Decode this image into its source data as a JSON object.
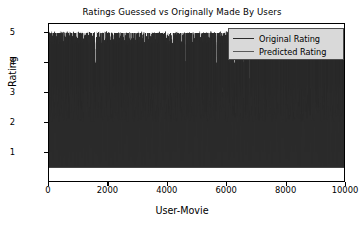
{
  "chart_data": {
    "type": "line",
    "title": "Ratings Guessed vs Originally Made By Users",
    "xlabel": "User-Movie",
    "ylabel": "Rating",
    "xlim": [
      0,
      10000
    ],
    "ylim": [
      0,
      5.3
    ],
    "grid": false,
    "legend_position": "upper right",
    "xticks": [
      "0",
      "2000",
      "4000",
      "6000",
      "8000",
      "10000"
    ],
    "xtick_values": [
      0,
      2000,
      4000,
      6000,
      8000,
      10000
    ],
    "yticks": [
      "1",
      "2",
      "3",
      "4",
      "5"
    ],
    "ytick_values": [
      1,
      2,
      3,
      4,
      5
    ],
    "series": [
      {
        "name": "Original Rating",
        "color": "#2b2b2b",
        "n_points": 10000,
        "value_range": [
          1,
          5
        ],
        "description": "Discrete integer user ratings 1-5 plotted densely across 10000 user-movie pairs, appearing as near-black overplotted vertical strokes spanning the full 1 to 5 range",
        "value_levels": [
          1,
          2,
          3,
          4,
          5
        ]
      },
      {
        "name": "Predicted Rating",
        "color": "#5a5a5a",
        "n_points": 10000,
        "value_range": [
          0.5,
          5
        ],
        "description": "Continuous model-predicted ratings across the same 10000 user-movie pairs, mid-gray, concentrated between about 2 and 4 with excursions down toward 0.5 and up to 5",
        "value_levels": [
          0.5,
          1.5,
          2,
          3,
          3.5,
          4,
          5
        ]
      }
    ],
    "legend": [
      {
        "label": "Original Rating",
        "color": "#2b2b2b"
      },
      {
        "label": "Predicted Rating",
        "color": "#5a5a5a"
      }
    ]
  },
  "colors": {
    "background": "#ffffff",
    "axis": "#000000",
    "text": "#000000",
    "original": "#2b2b2b",
    "predicted": "#5a5a5a",
    "legend_background": "#d9d9d9",
    "legend_border": "#4d4d4d"
  }
}
